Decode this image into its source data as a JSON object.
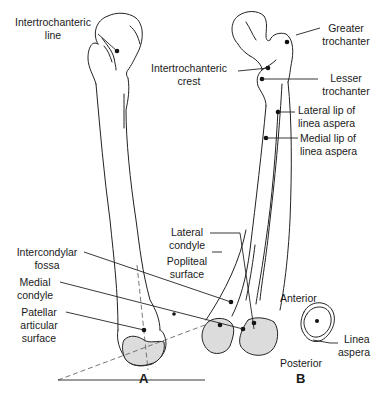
{
  "figure": {
    "panels": [
      {
        "id": "A",
        "letter": "A",
        "view": "anterior"
      },
      {
        "id": "B",
        "letter": "B",
        "view": "posterior"
      }
    ],
    "labels": {
      "intertrochanteric_line": [
        "Intertrochanteric",
        "line"
      ],
      "intertrochanteric_crest": [
        "Intertrochanteric",
        "crest"
      ],
      "greater_trochanter": [
        "Greater",
        "trochanter"
      ],
      "lesser_trochanter": [
        "Lesser",
        "trochanter"
      ],
      "lateral_lip": [
        "Lateral lip of",
        "linea aspera"
      ],
      "medial_lip": [
        "Medial lip of",
        "linea aspera"
      ],
      "lateral_condyle": [
        "Lateral",
        "condyle"
      ],
      "popliteal_surface": [
        "Popliteal",
        "surface"
      ],
      "intercondylar_fossa": [
        "Intercondylar",
        "fossa"
      ],
      "medial_condyle": [
        "Medial",
        "condyle"
      ],
      "patellar_surface": [
        "Patellar",
        "articular",
        "surface"
      ],
      "cross_section": {
        "anterior": "Anterior",
        "posterior": "Posterior",
        "linea_aspera": [
          "Linea",
          "aspera"
        ]
      }
    },
    "colors": {
      "line": "#222222",
      "shade": "#dcdcdc",
      "background": "#ffffff"
    }
  }
}
